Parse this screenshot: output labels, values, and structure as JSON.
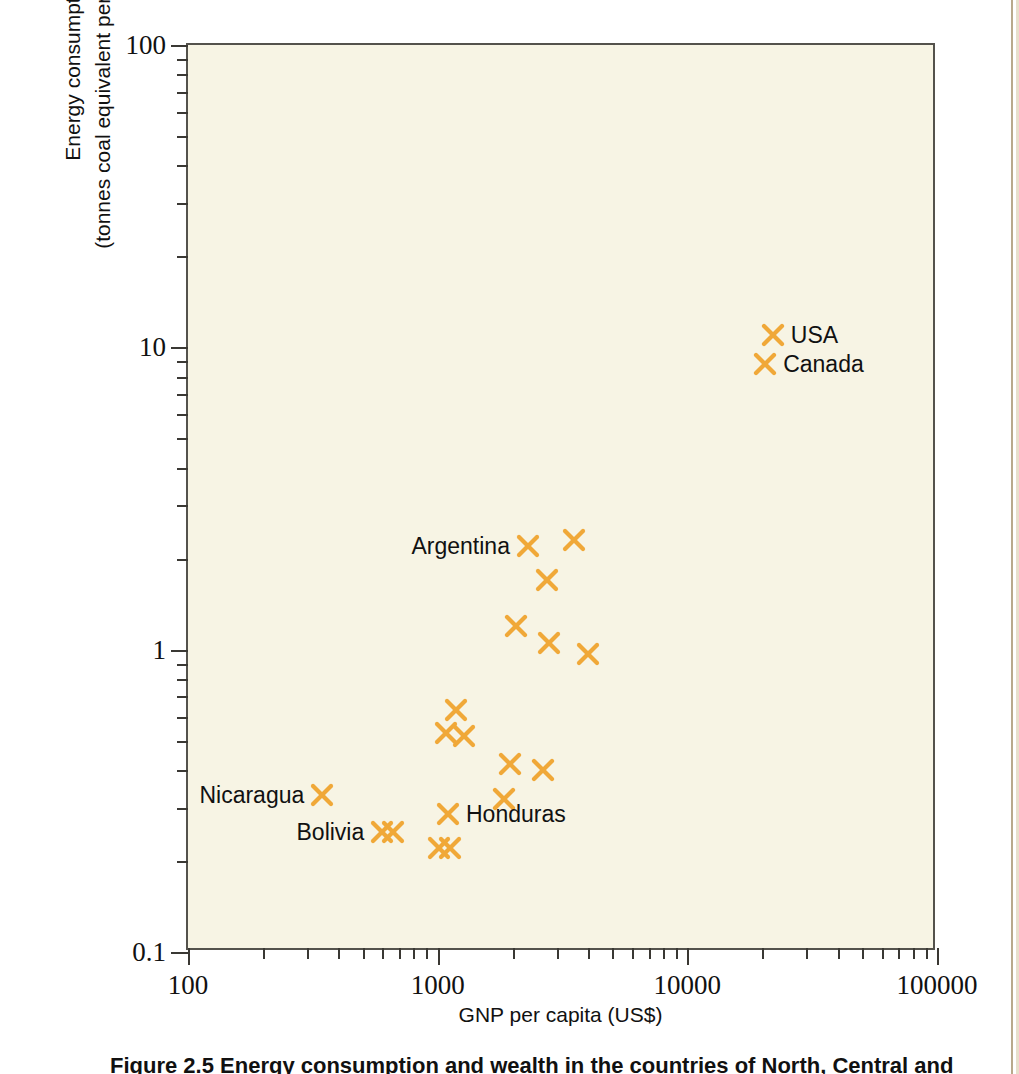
{
  "figure": {
    "caption": "Figure 2.5 Energy consumption and wealth in the countries of North, Central and"
  },
  "colors": {
    "marker": "#f0a838",
    "plot_background": "#f7f4e4",
    "axis": "#54524c",
    "text": "#111111",
    "page_edge": "#b9a98c"
  },
  "axes": {
    "x": {
      "title": "GNP per capita (US$)",
      "scale": "log",
      "min": 100,
      "max": 100000,
      "major_ticks": [
        {
          "value": 100,
          "label": "100"
        },
        {
          "value": 1000,
          "label": "1000"
        },
        {
          "value": 10000,
          "label": "10000"
        },
        {
          "value": 100000,
          "label": "100000"
        }
      ]
    },
    "y": {
      "title_line1": "Energy consumption",
      "title_line2": "(tonnes coal equivalent per capita/year)",
      "scale": "log",
      "min": 0.1,
      "max": 100,
      "major_ticks": [
        {
          "value": 0.1,
          "label": "0.1"
        },
        {
          "value": 1,
          "label": "1"
        },
        {
          "value": 10,
          "label": "10"
        },
        {
          "value": 100,
          "label": "100"
        }
      ]
    }
  },
  "chart_data": {
    "type": "scatter",
    "title": "Energy consumption and wealth in the countries of North, Central and",
    "xlabel": "GNP per capita (US$)",
    "ylabel": "Energy consumption (tonnes coal equivalent per capita/year)",
    "xscale": "log",
    "yscale": "log",
    "xlim": [
      100,
      100000
    ],
    "ylim": [
      0.1,
      100
    ],
    "grid": false,
    "legend": "none",
    "marker": "x",
    "marker_color": "#f0a838",
    "points": [
      {
        "label": "USA",
        "x": 22000,
        "y": 11.0,
        "label_side": "right"
      },
      {
        "label": "Canada",
        "x": 20500,
        "y": 8.8,
        "label_side": "right"
      },
      {
        "label": "Argentina",
        "x": 2300,
        "y": 2.2,
        "label_side": "left"
      },
      {
        "label": "",
        "x": 3500,
        "y": 2.3,
        "label_side": "none"
      },
      {
        "label": "",
        "x": 2750,
        "y": 1.7,
        "label_side": "none"
      },
      {
        "label": "",
        "x": 2050,
        "y": 1.2,
        "label_side": "none"
      },
      {
        "label": "",
        "x": 2800,
        "y": 1.05,
        "label_side": "none"
      },
      {
        "label": "",
        "x": 4000,
        "y": 0.97,
        "label_side": "none"
      },
      {
        "label": "",
        "x": 1180,
        "y": 0.63,
        "label_side": "none"
      },
      {
        "label": "",
        "x": 1080,
        "y": 0.53,
        "label_side": "none"
      },
      {
        "label": "",
        "x": 1280,
        "y": 0.52,
        "label_side": "none"
      },
      {
        "label": "",
        "x": 1950,
        "y": 0.42,
        "label_side": "none"
      },
      {
        "label": "",
        "x": 2650,
        "y": 0.4,
        "label_side": "none"
      },
      {
        "label": "",
        "x": 1850,
        "y": 0.32,
        "label_side": "none"
      },
      {
        "label": "Nicaragua",
        "x": 345,
        "y": 0.33,
        "label_side": "left"
      },
      {
        "label": "Honduras",
        "x": 1100,
        "y": 0.285,
        "label_side": "right"
      },
      {
        "label": "Bolivia",
        "x": 600,
        "y": 0.25,
        "label_side": "left"
      },
      {
        "label": "",
        "x": 660,
        "y": 0.25,
        "label_side": "none"
      },
      {
        "label": "El Salvador",
        "x": 1010,
        "y": 0.22,
        "label_side": "none"
      },
      {
        "label": "",
        "x": 1120,
        "y": 0.22,
        "label_side": "right"
      }
    ]
  }
}
